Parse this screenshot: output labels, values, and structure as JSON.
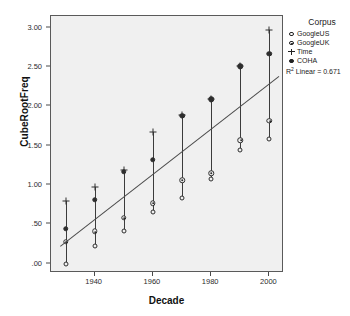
{
  "top_partial_text": "",
  "axes": {
    "xlabel": "Decade",
    "ylabel": "CubeRootFreq",
    "yticks": [
      "3.00",
      "2.50",
      "2.00",
      "1.50",
      "1.00",
      ".50",
      ".00"
    ],
    "xticks": [
      "1940",
      "1960",
      "1980",
      "2000"
    ]
  },
  "legend": {
    "title": "Corpus",
    "items": [
      {
        "label": "GoogleUS",
        "key": "open-circle-icon"
      },
      {
        "label": "GoogleUK",
        "key": "dotted-circle-icon"
      },
      {
        "label": "Time",
        "key": "plus-icon"
      },
      {
        "label": "COHA",
        "key": "filled-circle-icon"
      }
    ]
  },
  "annotation": {
    "r2_prefix": "R",
    "r2_sup": "2",
    "r2_text": " Linear = 0.671"
  },
  "chart_data": {
    "type": "scatter",
    "title": "",
    "xlabel": "Decade",
    "ylabel": "CubeRootFreq",
    "xlim": [
      1925,
      2005
    ],
    "ylim": [
      -0.12,
      3.15
    ],
    "xticks": [
      1940,
      1960,
      1980,
      2000
    ],
    "yticks": [
      0.0,
      0.5,
      1.0,
      1.5,
      2.0,
      2.5,
      3.0
    ],
    "ytick_labels": [
      ".00",
      ".50",
      "1.00",
      "1.50",
      "2.00",
      "2.50",
      "3.00"
    ],
    "grid": false,
    "legend_position": "right",
    "x": [
      1930,
      1940,
      1950,
      1960,
      1970,
      1980,
      1990,
      2000
    ],
    "series": [
      {
        "name": "GoogleUS",
        "marker": "open-circle",
        "values": [
          0.0,
          0.22,
          0.42,
          0.65,
          0.84,
          1.07,
          1.44,
          1.59
        ]
      },
      {
        "name": "GoogleUK",
        "marker": "dotted-circle",
        "values": [
          0.28,
          0.41,
          0.58,
          0.77,
          1.06,
          1.15,
          1.57,
          1.82
        ]
      },
      {
        "name": "Time",
        "marker": "plus",
        "values": [
          0.79,
          0.98,
          1.19,
          1.68,
          1.89,
          2.09,
          2.51,
          2.97
        ]
      },
      {
        "name": "COHA",
        "marker": "filled-circle",
        "values": [
          0.44,
          0.81,
          1.17,
          1.32,
          1.88,
          2.09,
          2.51,
          2.67
        ]
      }
    ],
    "fit": {
      "type": "linear",
      "r_squared": 0.671,
      "label": "R² Linear = 0.671",
      "x_endpoints": [
        1928,
        2003
      ],
      "y_endpoints": [
        0.22,
        2.38
      ]
    }
  }
}
